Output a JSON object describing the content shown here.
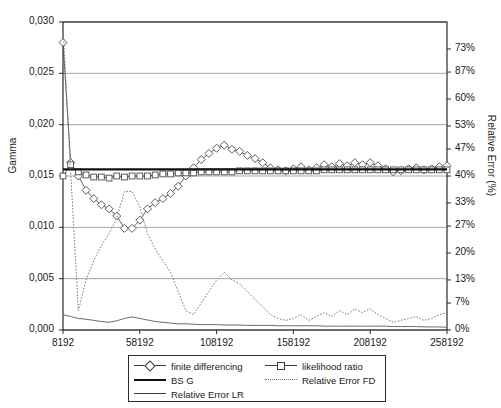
{
  "chart_data": {
    "type": "line",
    "title": "",
    "xlabel": "",
    "ylabel": "Gamma",
    "y2label": "Relative Error (%)",
    "grid": true,
    "legend_position": "bottom",
    "xlim": [
      8192,
      258192
    ],
    "ylim": [
      0.0,
      0.03
    ],
    "y2lim": [
      0,
      80
    ],
    "x_ticks": [
      "8192",
      "58192",
      "108192",
      "158192",
      "208192",
      "258192"
    ],
    "x_tick_values": [
      8192,
      58192,
      108192,
      158192,
      208192,
      258192
    ],
    "y_ticks": [
      "0,000",
      "0,005",
      "0,010",
      "0,015",
      "0,020",
      "0,025",
      "0,030"
    ],
    "y_tick_values": [
      0.0,
      0.005,
      0.01,
      0.015,
      0.02,
      0.025,
      0.03
    ],
    "y2_ticks": [
      "0%",
      "7%",
      "13%",
      "20%",
      "27%",
      "33%",
      "40%",
      "47%",
      "53%",
      "60%",
      "87%",
      "73%"
    ],
    "y2_tick_values": [
      0,
      7,
      13,
      20,
      27,
      33,
      40,
      47,
      53,
      60,
      67,
      73
    ],
    "x": [
      8192,
      13192,
      18192,
      23192,
      28192,
      33192,
      38192,
      43192,
      48192,
      53192,
      58192,
      63192,
      68192,
      73192,
      78192,
      83192,
      88192,
      93192,
      98192,
      103192,
      108192,
      113192,
      118192,
      123192,
      128192,
      133192,
      138192,
      143192,
      148192,
      153192,
      158192,
      163192,
      168192,
      173192,
      178192,
      183192,
      188192,
      193192,
      198192,
      203192,
      208192,
      213192,
      218192,
      223192,
      228192,
      233192,
      238192,
      243192,
      248192,
      253192,
      258192
    ],
    "series": [
      {
        "name": "finite differencing",
        "axis": "left",
        "style": "line-marker-diamond",
        "color": "#4a4a4a",
        "values": [
          0.028,
          0.0163,
          0.015,
          0.0136,
          0.0128,
          0.0122,
          0.0118,
          0.0111,
          0.0099,
          0.0099,
          0.0107,
          0.0118,
          0.0124,
          0.0128,
          0.0133,
          0.014,
          0.015,
          0.0158,
          0.0166,
          0.0172,
          0.0177,
          0.018,
          0.0176,
          0.0174,
          0.017,
          0.0167,
          0.0163,
          0.0158,
          0.0156,
          0.0155,
          0.0157,
          0.0159,
          0.0156,
          0.0158,
          0.0161,
          0.0159,
          0.0162,
          0.016,
          0.0163,
          0.0161,
          0.0163,
          0.016,
          0.0157,
          0.0154,
          0.0155,
          0.0157,
          0.0158,
          0.0156,
          0.0157,
          0.0159,
          0.016
        ]
      },
      {
        "name": "likelihood ratio",
        "axis": "left",
        "style": "line-marker-square",
        "color": "#4a4a4a",
        "values": [
          0.015,
          0.0161,
          0.0154,
          0.0151,
          0.0149,
          0.0149,
          0.0148,
          0.015,
          0.0149,
          0.015,
          0.015,
          0.015,
          0.0151,
          0.0152,
          0.0152,
          0.0153,
          0.0153,
          0.0153,
          0.0154,
          0.0154,
          0.0154,
          0.0154,
          0.0154,
          0.0155,
          0.0155,
          0.0155,
          0.0155,
          0.0155,
          0.0155,
          0.0155,
          0.0155,
          0.0155,
          0.0155,
          0.0155,
          0.0156,
          0.0156,
          0.0156,
          0.0156,
          0.0156,
          0.0156,
          0.0156,
          0.0156,
          0.0156,
          0.0156,
          0.0156,
          0.0156,
          0.0156,
          0.0156,
          0.0156,
          0.0156,
          0.0156
        ]
      },
      {
        "name": "BS G",
        "axis": "left",
        "style": "line-thick",
        "color": "#111111",
        "values": [
          0.01565,
          0.01565,
          0.01565,
          0.01565,
          0.01565,
          0.01565,
          0.01565,
          0.01565,
          0.01565,
          0.01565,
          0.01565,
          0.01565,
          0.01565,
          0.01565,
          0.01565,
          0.01565,
          0.01565,
          0.01565,
          0.01565,
          0.01565,
          0.01565,
          0.01565,
          0.01565,
          0.01565,
          0.01565,
          0.01565,
          0.01565,
          0.01565,
          0.01565,
          0.01565,
          0.01565,
          0.01565,
          0.01565,
          0.01565,
          0.01565,
          0.01565,
          0.01565,
          0.01565,
          0.01565,
          0.01565,
          0.01565,
          0.01565,
          0.01565,
          0.01565,
          0.01565,
          0.01565,
          0.01565,
          0.01565,
          0.01565,
          0.01565,
          0.01565
        ]
      },
      {
        "name": "Relative Error FD",
        "axis": "right",
        "style": "line-dotted",
        "color": "#7a7a7a",
        "values": [
          79.0,
          41.0,
          5.0,
          13.0,
          18.0,
          22.0,
          25.0,
          29.0,
          36.0,
          36.0,
          32.0,
          25.0,
          21.0,
          18.0,
          15.0,
          10.0,
          5.0,
          4.0,
          7.0,
          10.0,
          13.0,
          15.0,
          13.0,
          12.0,
          10.0,
          8.0,
          6.0,
          4.0,
          3.0,
          2.5,
          3.0,
          4.0,
          2.5,
          3.5,
          4.5,
          3.5,
          5.0,
          4.0,
          5.5,
          4.5,
          5.5,
          4.0,
          3.0,
          2.0,
          2.5,
          3.0,
          3.5,
          2.5,
          3.0,
          4.0,
          4.5
        ]
      },
      {
        "name": "Relative Error LR",
        "axis": "right",
        "style": "line-thin",
        "color": "#5a5a5a",
        "values": [
          4.0,
          3.5,
          3.0,
          2.8,
          2.5,
          2.2,
          2.0,
          2.4,
          3.0,
          3.4,
          3.0,
          2.6,
          2.2,
          2.0,
          1.8,
          1.6,
          1.6,
          1.5,
          1.4,
          1.4,
          1.4,
          1.3,
          1.3,
          1.3,
          1.2,
          1.2,
          1.2,
          1.2,
          1.1,
          1.1,
          1.1,
          1.1,
          1.1,
          1.1,
          1.0,
          1.0,
          1.0,
          1.0,
          1.0,
          1.0,
          1.0,
          1.0,
          1.0,
          0.9,
          0.9,
          0.9,
          0.9,
          0.8,
          0.8,
          0.8,
          0.7
        ]
      }
    ]
  },
  "axes": {
    "y_left_title": "Gamma",
    "y_right_title": "Relative Error (%)"
  },
  "legend": {
    "items": [
      {
        "label": "finite differencing",
        "key": "diamond"
      },
      {
        "label": "likelihood ratio",
        "key": "square"
      },
      {
        "label": "BS G",
        "key": "thick"
      },
      {
        "label": "Relative Error FD",
        "key": "dotted"
      },
      {
        "label": "Relative Error LR",
        "key": "thin"
      }
    ]
  },
  "colors": {
    "axis": "#2b2b2b",
    "grid": "#8d8d8d",
    "fd": "#4a4a4a",
    "lr": "#4a4a4a",
    "bsg": "#111111",
    "rel_fd": "#7a7a7a",
    "rel_lr": "#5a5a5a"
  }
}
